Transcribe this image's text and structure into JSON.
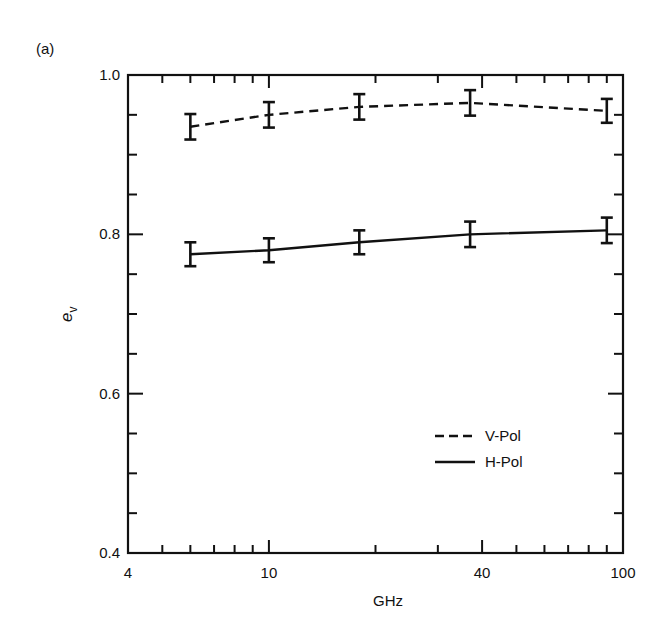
{
  "panel_label": "(a)",
  "chart_data": {
    "type": "line",
    "title": "",
    "xlabel": "GHz",
    "ylabel": "e",
    "ylabel_subscript": "v",
    "xscale": "log",
    "xlim": [
      4,
      100
    ],
    "ylim": [
      0.4,
      1.0
    ],
    "xticks_major": [
      4,
      10,
      40,
      100
    ],
    "xtick_labels": [
      "4",
      "10",
      "40",
      "100"
    ],
    "xticks_minor": [
      5,
      6,
      7,
      8,
      9,
      20,
      30,
      50,
      60,
      70,
      80,
      90
    ],
    "yticks_major": [
      0.4,
      0.6,
      0.8,
      1.0
    ],
    "ytick_labels": [
      "0.4",
      "0.6",
      "0.8",
      "1.0"
    ],
    "yticks_minor": [
      0.45,
      0.5,
      0.55,
      0.65,
      0.7,
      0.75,
      0.85,
      0.9,
      0.95
    ],
    "grid": false,
    "legend_position": "lower right",
    "x": [
      6,
      10,
      18,
      37,
      90
    ],
    "series": [
      {
        "name": "V-Pol",
        "style": "dashed",
        "values": [
          0.935,
          0.95,
          0.96,
          0.965,
          0.955
        ],
        "errors": [
          0.016,
          0.016,
          0.016,
          0.016,
          0.015
        ]
      },
      {
        "name": "H-Pol",
        "style": "solid",
        "values": [
          0.775,
          0.78,
          0.79,
          0.8,
          0.805
        ],
        "errors": [
          0.015,
          0.015,
          0.015,
          0.016,
          0.016
        ]
      }
    ]
  },
  "legend": {
    "items": [
      {
        "label": "V-Pol",
        "style": "dashed"
      },
      {
        "label": "H-Pol",
        "style": "solid"
      }
    ]
  },
  "colors": {
    "ink": "#111111",
    "background": "#ffffff"
  }
}
